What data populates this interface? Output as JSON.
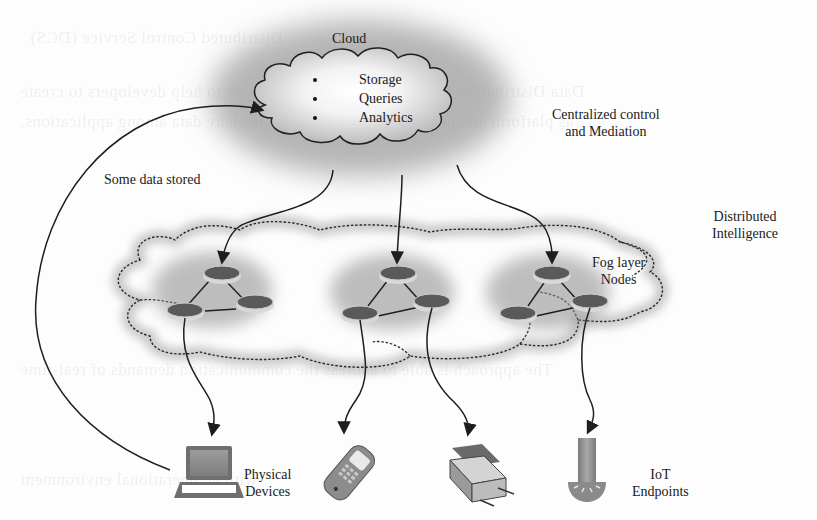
{
  "diagram": {
    "type": "cloud-fog-iot-architecture",
    "layers": {
      "cloud": {
        "title": "Cloud",
        "services": [
          "Storage",
          "Queries",
          "Analytics"
        ],
        "description_line1": "Centralized control",
        "description_line2": "and Mediation"
      },
      "fog": {
        "description_line1": "Distributed",
        "description_line2": "Intelligence",
        "nodes_label_line1": "Fog layer",
        "nodes_label_line2": "Nodes",
        "clusters": [
          {
            "name": "cluster-left",
            "nodes": 3
          },
          {
            "name": "cluster-middle",
            "nodes": 3
          },
          {
            "name": "cluster-right",
            "nodes": 3
          }
        ]
      },
      "edge": {
        "devices_label_line1": "Physical",
        "devices_label_line2": "Devices",
        "endpoints_label_line1": "IoT",
        "endpoints_label_line2": "Endpoints",
        "devices": [
          {
            "icon": "laptop-icon"
          },
          {
            "icon": "mobile-phone-icon"
          },
          {
            "icon": "scanner-printer-icon"
          },
          {
            "icon": "sensor-tower-icon"
          }
        ]
      }
    },
    "annotations": {
      "feedback_arrow_label": "Some data stored"
    },
    "edges": [
      {
        "from": "cloud",
        "to": "fog-cluster-left"
      },
      {
        "from": "cloud",
        "to": "fog-cluster-middle"
      },
      {
        "from": "cloud",
        "to": "fog-cluster-right"
      },
      {
        "from": "fog-cluster-left",
        "to": "laptop"
      },
      {
        "from": "fog-cluster-middle",
        "to": "mobile-phone"
      },
      {
        "from": "fog-cluster-middle",
        "to": "scanner"
      },
      {
        "from": "fog-cluster-right",
        "to": "sensor"
      },
      {
        "from": "laptop",
        "to": "cloud"
      }
    ]
  },
  "colors": {
    "line": "#1e1e1e",
    "node_fill": "#5a5a5a",
    "node_rim": "#d8d8d8",
    "halo": "#9a9a9a",
    "device_gray": "#8a8a8a"
  },
  "background_bleed_text": [
    "Distributed Control Service (DCS)",
    "Data Distribution Service (DDS) is a middleware to help developers to create",
    "as platform and network independent way to share data among applications.",
    "The approach is able to address the communication demands of real-time",
    "with an operational environment"
  ]
}
